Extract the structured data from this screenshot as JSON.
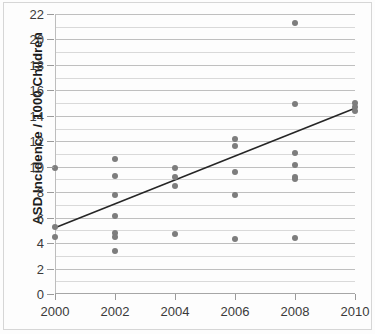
{
  "figure": {
    "title": "",
    "ylabel": "ASD  Incidence / 1000 Children",
    "xlabel": "",
    "marker_color": "#7d7d7d",
    "trendline_color": "#262626",
    "gridline_color": "#bfbfbf",
    "minor_gridline_color": "#d9d9d9",
    "axis_color": "#a6a6a6"
  },
  "chart_data": {
    "type": "scatter",
    "title": "",
    "xlabel": "",
    "ylabel": "ASD  Incidence / 1000 Children",
    "xlim": [
      2000,
      2010
    ],
    "ylim": [
      0,
      22
    ],
    "xticks": [
      2000,
      2002,
      2004,
      2006,
      2008,
      2010
    ],
    "xtick_labels": [
      "2000",
      "2002",
      "2004",
      "2006",
      "2008",
      "2010"
    ],
    "yticks": [
      0,
      2,
      4,
      6,
      8,
      10,
      12,
      14,
      16,
      18,
      20,
      22
    ],
    "ytick_labels": [
      "0",
      "2",
      "4",
      "6",
      "8",
      "10",
      "12",
      "14",
      "16",
      "18",
      "20",
      "22"
    ],
    "minor_yticks": [
      1,
      3,
      5,
      7,
      9,
      11,
      13,
      15,
      17,
      19,
      21
    ],
    "grid": true,
    "legend": false,
    "legend_position": "none",
    "series": [
      {
        "name": "ASD incidence observations",
        "type": "scatter",
        "marker": "circle",
        "color": "#7d7d7d",
        "points": [
          {
            "x": 2000,
            "y": 9.9
          },
          {
            "x": 2000,
            "y": 5.3
          },
          {
            "x": 2000,
            "y": 4.5
          },
          {
            "x": 2002,
            "y": 10.6
          },
          {
            "x": 2002,
            "y": 9.3
          },
          {
            "x": 2002,
            "y": 7.8
          },
          {
            "x": 2002,
            "y": 6.1
          },
          {
            "x": 2002,
            "y": 4.8
          },
          {
            "x": 2002,
            "y": 4.5
          },
          {
            "x": 2002,
            "y": 3.4
          },
          {
            "x": 2004,
            "y": 9.9
          },
          {
            "x": 2004,
            "y": 9.2
          },
          {
            "x": 2004,
            "y": 8.5
          },
          {
            "x": 2004,
            "y": 4.7
          },
          {
            "x": 2006,
            "y": 12.2
          },
          {
            "x": 2006,
            "y": 11.6
          },
          {
            "x": 2006,
            "y": 9.6
          },
          {
            "x": 2006,
            "y": 7.8
          },
          {
            "x": 2006,
            "y": 4.3
          },
          {
            "x": 2008,
            "y": 21.3
          },
          {
            "x": 2008,
            "y": 14.9
          },
          {
            "x": 2008,
            "y": 11.1
          },
          {
            "x": 2008,
            "y": 10.1
          },
          {
            "x": 2008,
            "y": 9.2
          },
          {
            "x": 2008,
            "y": 9.0
          },
          {
            "x": 2008,
            "y": 4.4
          },
          {
            "x": 2010,
            "y": 15.0
          },
          {
            "x": 2010,
            "y": 14.7
          },
          {
            "x": 2010,
            "y": 14.4
          }
        ]
      },
      {
        "name": "linear trendline",
        "type": "line",
        "color": "#262626",
        "points": [
          {
            "x": 2000,
            "y": 5.2
          },
          {
            "x": 2010,
            "y": 14.6
          }
        ]
      }
    ]
  }
}
